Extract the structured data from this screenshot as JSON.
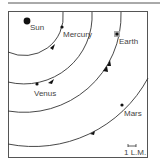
{
  "diagram": {
    "type": "orbit-diagram",
    "colors": {
      "line": "#333333",
      "frame": "#555555",
      "label": "#444444",
      "earth_marker": "#999999"
    },
    "sun": {
      "label": "Sun"
    },
    "planets": [
      {
        "name": "Mercury",
        "label": "Mercury"
      },
      {
        "name": "Venus",
        "label": "Venus"
      },
      {
        "name": "Earth",
        "label": "Earth"
      },
      {
        "name": "Mars",
        "label": "Mars"
      }
    ],
    "scale": {
      "label": "1 L.M."
    }
  }
}
